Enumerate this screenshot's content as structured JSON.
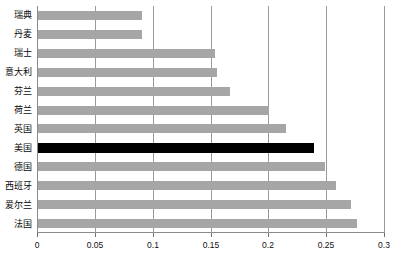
{
  "chart_data": {
    "type": "bar",
    "orientation": "horizontal",
    "title": "",
    "subtitle": "",
    "xlabel": "",
    "ylabel": "",
    "xlim": [
      0,
      0.3
    ],
    "ylim": null,
    "grid": true,
    "legend": null,
    "legend_position": "none",
    "xticks": [
      "0",
      "0.05",
      "0.1",
      "0.15",
      "0.2",
      "0.25",
      "0.3"
    ],
    "xtick_values": [
      0,
      0.05,
      0.1,
      0.15,
      0.2,
      0.25,
      0.3
    ],
    "categories": [
      "瑞典",
      "丹麦",
      "瑞士",
      "意大利",
      "芬兰",
      "荷兰",
      "英国",
      "美国",
      "德国",
      "西班牙",
      "爱尔兰",
      "法国"
    ],
    "values": [
      0.09,
      0.09,
      0.153,
      0.155,
      0.166,
      0.2,
      0.214,
      0.239,
      0.248,
      0.258,
      0.271,
      0.276
    ],
    "highlight_category": "美国",
    "highlight_index": 7,
    "colors": {
      "bar": "#a6a6a6",
      "bar_highlight": "#000000",
      "gridline": "#9a9a9a",
      "axis": "#8a8a8a",
      "text": "#0b0b0b",
      "background": "#ffffff"
    }
  }
}
